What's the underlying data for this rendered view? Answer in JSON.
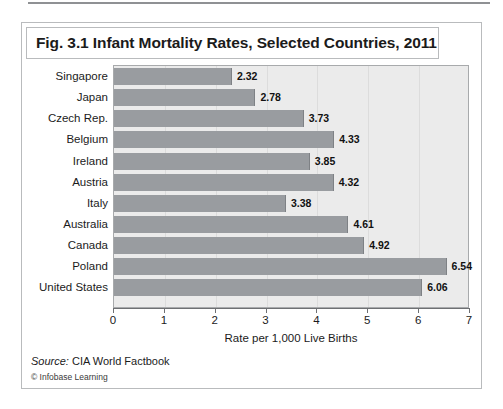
{
  "figure": {
    "title": "Fig. 3.1 Infant Mortality Rates, Selected Countries, 2011",
    "source_prefix": "Source:",
    "source_text": "CIA World Factbook",
    "copyright": "© Infobase Learning"
  },
  "chart_data": {
    "type": "bar",
    "orientation": "horizontal",
    "title": "Fig. 3.1 Infant Mortality Rates, Selected Countries, 2011",
    "xlabel": "Rate per 1,000 Live Births",
    "ylabel": "",
    "xlim": [
      0,
      7
    ],
    "xticks": [
      0,
      1,
      2,
      3,
      4,
      5,
      6,
      7
    ],
    "xtick_labels": [
      "0",
      "1",
      "2",
      "3",
      "4",
      "5",
      "6",
      "7"
    ],
    "grid": true,
    "legend": null,
    "categories": [
      "Singapore",
      "Japan",
      "Czech Rep.",
      "Belgium",
      "Ireland",
      "Austria",
      "Italy",
      "Australia",
      "Canada",
      "Poland",
      "United States"
    ],
    "values": [
      2.32,
      2.78,
      3.73,
      4.33,
      3.85,
      4.32,
      3.38,
      4.61,
      4.92,
      6.54,
      6.06
    ],
    "data_labels": [
      "2.32",
      "2.78",
      "3.73",
      "4.33",
      "3.85",
      "4.32",
      "3.38",
      "4.61",
      "4.92",
      "6.54",
      "6.06"
    ],
    "source": "CIA World Factbook",
    "colors": {
      "bar": "#999ca0",
      "bar_edge": "#7e8185",
      "plot_background": "#ebebeb",
      "plot_border": "#a8aaac",
      "gridline": "#dcdcdc",
      "text": "#1b1b1b",
      "frame": "#b9bbbd"
    }
  }
}
